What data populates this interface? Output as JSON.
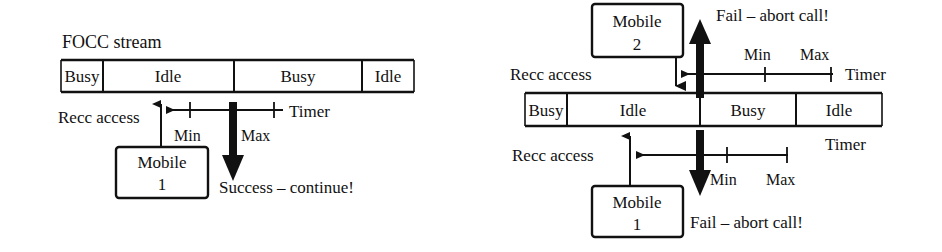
{
  "figure": {
    "type": "protocol-timing-diagram"
  },
  "panels": [
    {
      "id": "left",
      "title": "FOCC stream",
      "stream": {
        "segments": [
          {
            "label": "Busy"
          },
          {
            "label": "Idle"
          },
          {
            "label": "Busy"
          },
          {
            "label": "Idle"
          }
        ]
      },
      "annotations": {
        "recc_access": "Recc access",
        "timer": "Timer",
        "min": "Min",
        "max": "Max",
        "outcome": "Success – continue!"
      },
      "mobiles": [
        {
          "name": "Mobile",
          "number": "1"
        }
      ]
    },
    {
      "id": "right",
      "title": "",
      "stream": {
        "segments": [
          {
            "label": "Busy"
          },
          {
            "label": "Idle"
          },
          {
            "label": "Busy"
          },
          {
            "label": "Idle"
          }
        ]
      },
      "annotations": {
        "recc_access_top": "Recc access",
        "recc_access_bottom": "Recc access",
        "timer_top": "Timer",
        "timer_bottom": "Timer",
        "min_top": "Min",
        "max_top": "Max",
        "min_bottom": "Min",
        "max_bottom": "Max",
        "outcome_top": "Fail – abort call!",
        "outcome_bottom": "Fail – abort call!"
      },
      "mobiles": [
        {
          "name": "Mobile",
          "number": "2"
        },
        {
          "name": "Mobile",
          "number": "1"
        }
      ]
    }
  ],
  "colors": {
    "ink": "#111111",
    "background": "#ffffff"
  }
}
